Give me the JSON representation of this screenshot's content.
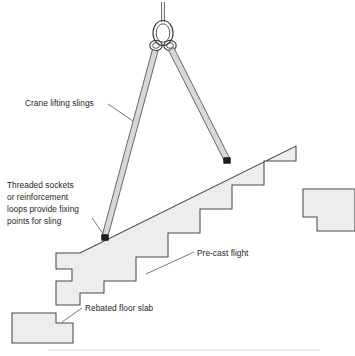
{
  "diagram": {
    "background_color": "#ffffff",
    "concrete_fill_color": "#ededed",
    "outline_color": "#4a4a4a",
    "text_color": "#231f20",
    "sling_fill_color": "#d8d8d8"
  },
  "labels": {
    "crane_slings": {
      "line1": "Crane lifting slings"
    },
    "threaded_sockets": {
      "line1": "Threaded sockets",
      "line2": "or reinforcement",
      "line3": "loops provide fixing",
      "line4": "points for sling"
    },
    "precast_flight": {
      "line1": "Pre-cast flight"
    },
    "rebated_floor_slab": {
      "line1": "Rebated floor slab"
    }
  },
  "components": {
    "lifting_ring": "crane-lifting-ring",
    "shackle_left": "shackle-loop-left",
    "shackle_right": "shackle-loop-right",
    "sling_left": "lifting-sling-left",
    "sling_right": "lifting-sling-right",
    "socket_left": "fixing-socket-lower",
    "socket_right": "fixing-socket-upper",
    "stair": "precast-stair-flight",
    "landing_slab": "upper-landing-slab",
    "floor_slab": "rebated-floor-slab"
  },
  "geometry": {
    "stair_outline": "M 56,252 L 56,240 L 72,240 L 72,280 L 56,280 L 56,292 L 80,292 L 80,304 L 104,304 L 104,280 L 136,280 L 136,256 L 168,256 L 168,232 L 200,232 L 200,208 L 232,208 L 232,184 L 264,184 L 264,160 L 296,160 L 296,146 L 262,146 L 262,170 L 230,170 L 230,194 L 198,194 L 198,218 L 166,218 L 166,242 L 134,242 L 134,266 L 102,266 L 102,290 L 80,290 L 80,252 Z",
    "landing_slab_outline": "M 300,188 L 355,188 L 355,230 L 316,230 L 316,216 L 300,216 Z",
    "floor_slab_outline": "M 12,312 L 56,312 L 56,322 L 72,322 L 72,342 L 12,342 Z",
    "sling_left_path": "M 160,44 L 105,240",
    "sling_right_path": "M 166,44 L 228,163",
    "cable_top": "M 163,2 L 163,22"
  }
}
